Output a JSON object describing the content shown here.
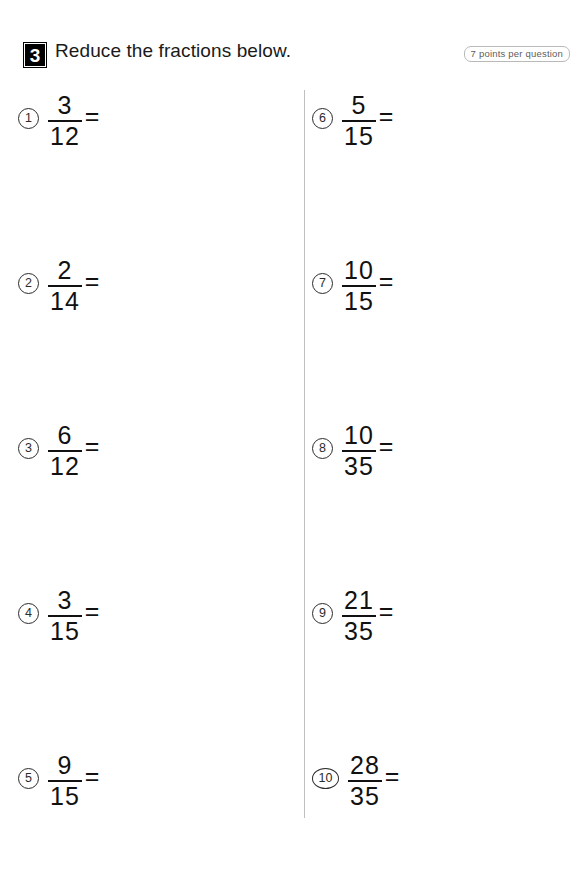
{
  "header": {
    "section_number": "3",
    "title": "Reduce the fractions below.",
    "points_badge": "7 points per question"
  },
  "worksheet": {
    "equals_sign": "=",
    "left_column": [
      {
        "index": "1",
        "numerator": "3",
        "denominator": "12"
      },
      {
        "index": "2",
        "numerator": "2",
        "denominator": "14"
      },
      {
        "index": "3",
        "numerator": "6",
        "denominator": "12"
      },
      {
        "index": "4",
        "numerator": "3",
        "denominator": "15"
      },
      {
        "index": "5",
        "numerator": "9",
        "denominator": "15"
      }
    ],
    "right_column": [
      {
        "index": "6",
        "numerator": "5",
        "denominator": "15"
      },
      {
        "index": "7",
        "numerator": "10",
        "denominator": "15"
      },
      {
        "index": "8",
        "numerator": "10",
        "denominator": "35"
      },
      {
        "index": "9",
        "numerator": "21",
        "denominator": "35"
      },
      {
        "index": "10",
        "numerator": "28",
        "denominator": "35"
      }
    ]
  }
}
